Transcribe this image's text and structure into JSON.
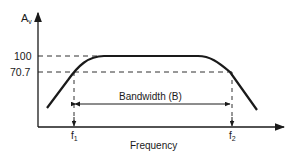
{
  "diagram": {
    "y_axis": {
      "label": "A",
      "label_subscript": "v"
    },
    "x_axis": {
      "label": "Frequency"
    },
    "levels": [
      {
        "value": "100"
      },
      {
        "value": "70.7"
      }
    ],
    "markers": [
      {
        "label": "f",
        "subscript": "1"
      },
      {
        "label": "f",
        "subscript": "2"
      }
    ],
    "bandwidth_label": "Bandwidth (B)",
    "colors": {
      "line": "#1a1a1a",
      "background": "#ffffff"
    }
  }
}
